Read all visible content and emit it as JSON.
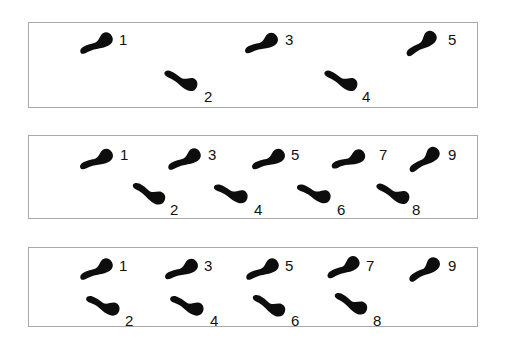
{
  "figure": {
    "background_color": "#ffffff",
    "ink_color": "#0d0d0d",
    "panel_border_color": "#a9a9a9",
    "label_color": "#111111",
    "label_font_size_px": 15,
    "panel_count": 3
  },
  "panels": [
    {
      "id": "panel-1",
      "index": 1,
      "x": 28,
      "y": 22,
      "width": 450,
      "height": 86,
      "footprint_count": 5,
      "footprints": [
        {
          "number": "1",
          "side": "top",
          "x": 96,
          "y": 43,
          "angle": -30,
          "length": 38,
          "width": 15,
          "label_x": 118,
          "label_y": 31
        },
        {
          "number": "2",
          "side": "bottom",
          "x": 180,
          "y": 79,
          "angle": 22,
          "length": 38,
          "width": 15,
          "label_x": 203,
          "label_y": 88
        },
        {
          "number": "3",
          "side": "top",
          "x": 261,
          "y": 43,
          "angle": -28,
          "length": 38,
          "width": 15,
          "label_x": 284,
          "label_y": 31
        },
        {
          "number": "4",
          "side": "bottom",
          "x": 340,
          "y": 79,
          "angle": 22,
          "length": 38,
          "width": 15,
          "label_x": 361,
          "label_y": 88
        },
        {
          "number": "5",
          "side": "top",
          "x": 421,
          "y": 43,
          "angle": -40,
          "length": 38,
          "width": 15,
          "label_x": 447,
          "label_y": 31
        }
      ]
    },
    {
      "id": "panel-2",
      "index": 2,
      "x": 28,
      "y": 135,
      "width": 450,
      "height": 84,
      "footprint_count": 9,
      "footprints": [
        {
          "number": "1",
          "side": "top",
          "x": 96,
          "y": 159,
          "angle": -28,
          "length": 38,
          "width": 15,
          "label_x": 119,
          "label_y": 146
        },
        {
          "number": "2",
          "side": "bottom",
          "x": 148,
          "y": 192,
          "angle": 25,
          "length": 38,
          "width": 15,
          "label_x": 169,
          "label_y": 201
        },
        {
          "number": "3",
          "side": "top",
          "x": 184,
          "y": 159,
          "angle": -30,
          "length": 38,
          "width": 15,
          "label_x": 207,
          "label_y": 146
        },
        {
          "number": "4",
          "side": "bottom",
          "x": 230,
          "y": 192,
          "angle": 18,
          "length": 38,
          "width": 15,
          "label_x": 253,
          "label_y": 201
        },
        {
          "number": "5",
          "side": "top",
          "x": 268,
          "y": 159,
          "angle": -28,
          "length": 38,
          "width": 15,
          "label_x": 290,
          "label_y": 146
        },
        {
          "number": "6",
          "side": "bottom",
          "x": 313,
          "y": 192,
          "angle": 18,
          "length": 38,
          "width": 15,
          "label_x": 336,
          "label_y": 201
        },
        {
          "number": "7",
          "side": "top",
          "x": 348,
          "y": 159,
          "angle": -25,
          "length": 38,
          "width": 15,
          "label_x": 378,
          "label_y": 146
        },
        {
          "number": "8",
          "side": "bottom",
          "x": 392,
          "y": 192,
          "angle": 22,
          "length": 38,
          "width": 15,
          "label_x": 411,
          "label_y": 201
        },
        {
          "number": "9",
          "side": "top",
          "x": 424,
          "y": 159,
          "angle": -40,
          "length": 38,
          "width": 15,
          "label_x": 447,
          "label_y": 146
        }
      ]
    },
    {
      "id": "panel-3",
      "index": 3,
      "x": 28,
      "y": 247,
      "width": 450,
      "height": 80,
      "footprint_count": 9,
      "footprints": [
        {
          "number": "1",
          "side": "top",
          "x": 96,
          "y": 269,
          "angle": -30,
          "length": 38,
          "width": 15,
          "label_x": 118,
          "label_y": 257
        },
        {
          "number": "2",
          "side": "bottom",
          "x": 102,
          "y": 304,
          "angle": 20,
          "length": 38,
          "width": 15,
          "label_x": 124,
          "label_y": 312
        },
        {
          "number": "3",
          "side": "top",
          "x": 181,
          "y": 269,
          "angle": -28,
          "length": 38,
          "width": 15,
          "label_x": 203,
          "label_y": 257
        },
        {
          "number": "4",
          "side": "bottom",
          "x": 186,
          "y": 304,
          "angle": 20,
          "length": 38,
          "width": 15,
          "label_x": 209,
          "label_y": 312
        },
        {
          "number": "5",
          "side": "top",
          "x": 262,
          "y": 269,
          "angle": -30,
          "length": 38,
          "width": 15,
          "label_x": 284,
          "label_y": 257
        },
        {
          "number": "6",
          "side": "bottom",
          "x": 268,
          "y": 304,
          "angle": 25,
          "length": 38,
          "width": 15,
          "label_x": 290,
          "label_y": 312
        },
        {
          "number": "7",
          "side": "top",
          "x": 343,
          "y": 267,
          "angle": -32,
          "length": 38,
          "width": 15,
          "label_x": 365,
          "label_y": 257
        },
        {
          "number": "8",
          "side": "bottom",
          "x": 350,
          "y": 302,
          "angle": 25,
          "length": 38,
          "width": 15,
          "label_x": 372,
          "label_y": 312
        },
        {
          "number": "9",
          "side": "top",
          "x": 424,
          "y": 269,
          "angle": -38,
          "length": 38,
          "width": 15,
          "label_x": 447,
          "label_y": 257
        }
      ]
    }
  ]
}
